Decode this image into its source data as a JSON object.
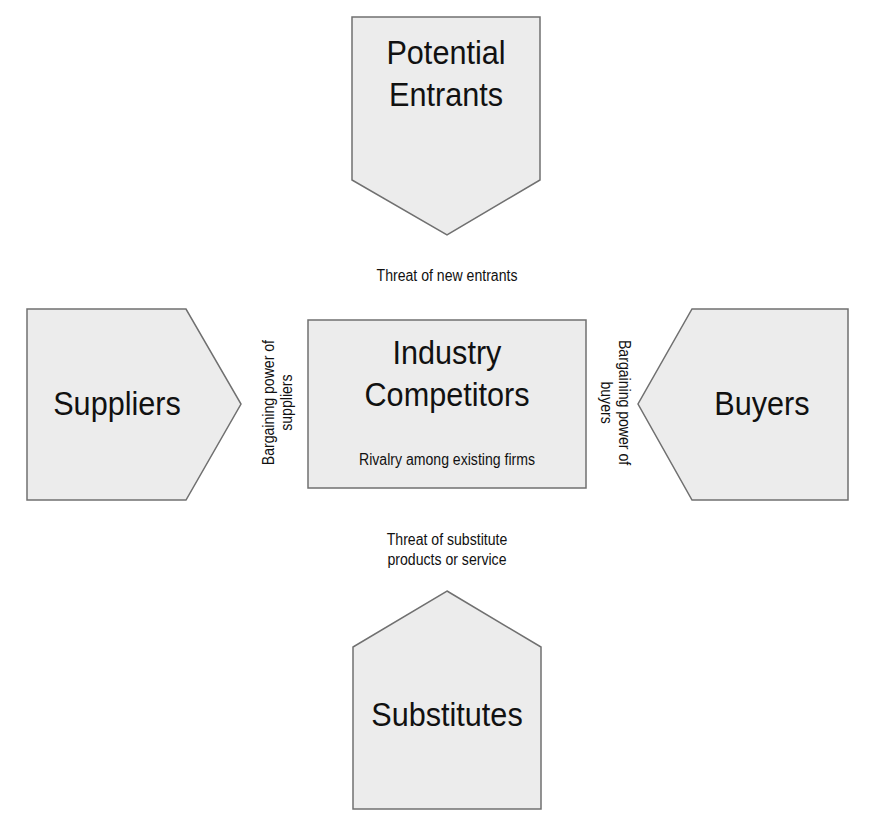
{
  "diagram": {
    "fill_color": "#ececec",
    "stroke_color": "#707070",
    "nodes": {
      "potential_entrants": {
        "line1": "Potential",
        "line2": "Entrants"
      },
      "suppliers": {
        "label": "Suppliers"
      },
      "industry": {
        "line1": "Industry",
        "line2": "Competitors",
        "sub": "Rivalry among existing firms"
      },
      "buyers": {
        "label": "Buyers"
      },
      "substitutes": {
        "label": "Substitutes"
      }
    },
    "forces": {
      "new_entrants": "Threat of new entrants",
      "suppliers_line1": "Bargaining power of",
      "suppliers_line2": "suppliers",
      "buyers_line1": "Bargaining power of",
      "buyers_line2": "buyers",
      "substitutes_line1": "Threat of substitute",
      "substitutes_line2": "products or service"
    }
  }
}
